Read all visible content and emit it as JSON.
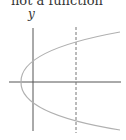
{
  "caption": "not a function",
  "axes": {
    "y_label": "y"
  },
  "figure": {
    "curve_color": "#b0b0b0",
    "axis_color": "#555555",
    "dashed_line_color": "#777777"
  }
}
